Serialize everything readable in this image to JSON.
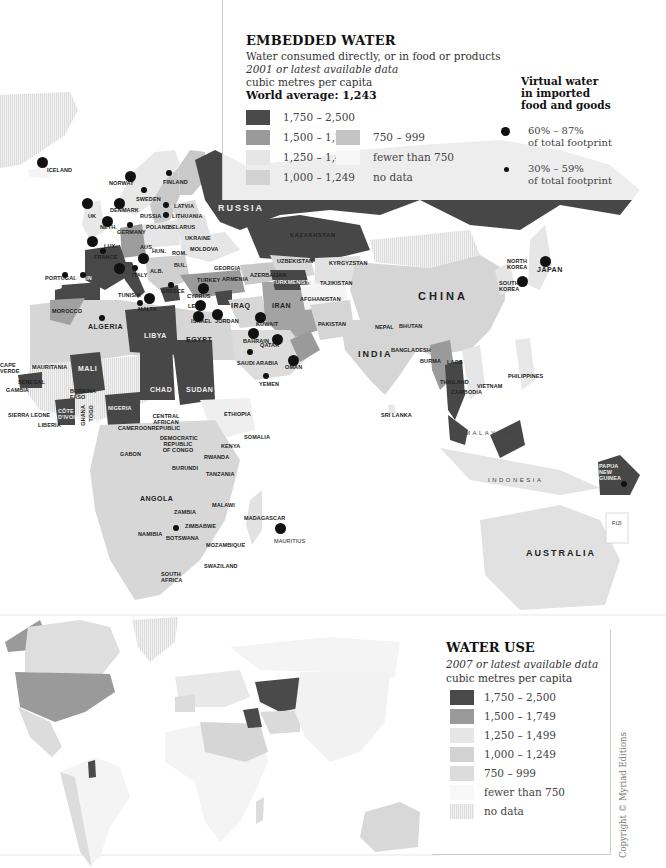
{
  "embedded_water": {
    "title": "EMBEDDED WATER",
    "subtitle": "Water consumed directly, or in food or products",
    "data_year": "2001 or latest available data",
    "unit": "cubic metres per capita",
    "world_average": "World average: 1,243",
    "legend": [
      {
        "label": "1,750 – 2,500",
        "color": "#4a4a4a"
      },
      {
        "label": "1,500 – 1,749",
        "color": "#9a9a9a"
      },
      {
        "label": "1,250 – 1,499",
        "color": "#e6e6e6"
      },
      {
        "label": "1,000 – 1,249",
        "color": "#d2d2d2"
      },
      {
        "label": "750 – 999",
        "color": "#c4c4c4"
      },
      {
        "label": "fewer than 750",
        "color": "#f6f6f6"
      },
      {
        "label": "no data",
        "color": "#ececec"
      }
    ],
    "virtual_water": {
      "title_lines": [
        "Virtual water",
        "in imported",
        "food and goods"
      ],
      "items": [
        {
          "label_lines": [
            "60% – 87%",
            "of total footprint"
          ],
          "size": "large"
        },
        {
          "label_lines": [
            "30% – 59%",
            "of total footprint"
          ],
          "size": "small"
        }
      ]
    }
  },
  "country_labels": {
    "iceland": "ICELAND",
    "norway": "NORWAY",
    "finland": "FINLAND",
    "sweden": "SWEDEN",
    "uk": "UK",
    "denmark": "DENMARK",
    "latvia": "LATVIA",
    "russia_small": "RUSSIA",
    "lithuania": "LITHUANIA",
    "neth": "NETH.",
    "germany": "GERMANY",
    "poland": "POLAND",
    "belarus": "BELARUS",
    "ukraine": "UKRAINE",
    "moldova": "MOLDOVA",
    "rom": "ROM.",
    "hun": "HUN.",
    "france": "FRANCE",
    "lux": "LUX.",
    "aus": "AUS.",
    "bul": "BUL.",
    "alb": "ALB.",
    "italy": "ITALY",
    "greece": "GREECE",
    "portugal": "PORTUGAL",
    "spain": "SPAIN",
    "georgia": "GEORGIA",
    "armenia": "ARMENIA",
    "azerbaijan": "AZERBAIJAN",
    "turkey": "TURKEY",
    "cyprus": "CYPRUS",
    "leb": "LEB.",
    "israel": "ISRAEL",
    "jordan": "JORDAN",
    "iraq": "IRAQ",
    "iran": "IRAN",
    "kuwait": "KUWAIT",
    "bahrain": "BAHRAIN",
    "qatar": "QATAR",
    "saudi_arabia": "SAUDI ARABIA",
    "oman": "OMAN",
    "yemen": "YEMEN",
    "russia": "RUSSIA",
    "kazakhstan": "KAZAKHSTAN",
    "uzbekistan": "UZBEKISTAN",
    "turkmenistan": "TURKMENISTAN",
    "kyrgyzstan": "KYRGYZSTAN",
    "tajikistan": "TAJIKISTAN",
    "afghanistan": "AFGHANISTAN",
    "pakistan": "PAKISTAN",
    "india": "INDIA",
    "nepal": "NEPAL",
    "bhutan": "BHUTAN",
    "bangladesh": "BANGLADESH",
    "burma": "BURMA",
    "china": "CHINA",
    "north_korea": "NORTH KOREA",
    "south_korea": "SOUTH KOREA",
    "japan": "JAPAN",
    "laos": "LAOS",
    "thailand": "THAILAND",
    "cambodia": "CAMBODIA",
    "vietnam": "VIETNAM",
    "philippines": "PHILIPPINES",
    "malaysia": "MALAYSIA",
    "sri_lanka": "SRI LANKA",
    "indonesia": "INDONESIA",
    "papua_new_guinea": "PAPUA NEW GUINEA",
    "fiji": "FIJI",
    "australia": "AUSTRALIA",
    "tunisia": "TUNISIA",
    "malta": "MALTA",
    "morocco": "MOROCCO",
    "algeria": "ALGERIA",
    "libya": "LIBYA",
    "egypt": "EGYPT",
    "mauritania": "MAURITANIA",
    "mali": "MALI",
    "cape_verde": "CAPE VERDE",
    "senegal": "SENEGAL",
    "gambia": "GAMBIA",
    "burkina_faso": "BURKINA FASO",
    "sierra_leone": "SIERRA LEONE",
    "liberia": "LIBERIA",
    "cote_divoire": "CÔTE D'IVOIRE",
    "ghana": "GHANA",
    "togo": "TOGO",
    "benin": "BENIN",
    "nigeria": "NIGERIA",
    "chad": "CHAD",
    "sudan": "SUDAN",
    "ethiopia": "ETHIOPIA",
    "somalia": "SOMALIA",
    "cameroon": "CAMEROON",
    "car": "CENTRAL AFRICAN REPUBLIC",
    "gabon": "GABON",
    "drc": "DEMOCRATIC REPUBLIC OF CONGO",
    "kenya": "KENYA",
    "rwanda": "RWANDA",
    "burundi": "BURUNDI",
    "tanzania": "TANZANIA",
    "angola": "ANGOLA",
    "zambia": "ZAMBIA",
    "malawi": "MALAWI",
    "zimbabwe": "ZIMBABWE",
    "namibia": "NAMIBIA",
    "botswana": "BOTSWANA",
    "mozambique": "MOZAMBIQUE",
    "madagascar": "MADAGASCAR",
    "mauritius": "MAURITIUS",
    "swaziland": "SWAZILAND",
    "south_africa": "SOUTH AFRICA"
  },
  "water_use": {
    "title": "WATER USE",
    "data_year": "2007 or latest available data",
    "unit": "cubic metres per capita",
    "legend": [
      {
        "label": "1,750 – 2,500",
        "color": "#4a4a4a"
      },
      {
        "label": "1,500 – 1,749",
        "color": "#9a9a9a"
      },
      {
        "label": "1,250 – 1,499",
        "color": "#e6e6e6"
      },
      {
        "label": "1,000 – 1,249",
        "color": "#d2d2d2"
      },
      {
        "label": "750 – 999",
        "color": "#c4c4c4"
      },
      {
        "label": "fewer than 750",
        "color": "#f8f8f8"
      },
      {
        "label": "no data",
        "color": "#ececec"
      }
    ]
  },
  "copyright": "Copyright © Myriad Editions"
}
